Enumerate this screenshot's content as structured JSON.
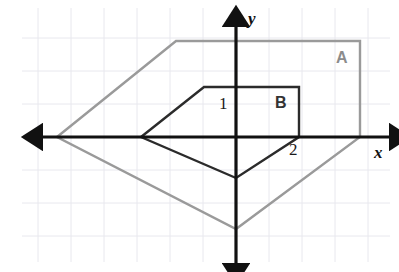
{
  "figure": {
    "width": 399,
    "height": 272,
    "background_color": "#ffffff"
  },
  "grid": {
    "visible": true,
    "spacing_px": 33,
    "color": "#e8e8ee",
    "origin_px": {
      "x": 236,
      "y": 137
    },
    "extent_px": {
      "left": 22,
      "right": 390,
      "top": 8,
      "bottom": 262
    }
  },
  "axes": {
    "color": "#111111",
    "stroke_width": 3.2,
    "x_axis": {
      "label": "x",
      "label_pos_px": {
        "x": 374,
        "y": 144
      },
      "from_px": {
        "x": 24,
        "y": 137
      },
      "to_px": {
        "x": 392,
        "y": 137
      },
      "arrows": "both"
    },
    "y_axis": {
      "label": "y",
      "label_pos_px": {
        "x": 248,
        "y": 10
      },
      "from_px": {
        "x": 236,
        "y": 8
      },
      "to_px": {
        "x": 236,
        "y": 266
      },
      "arrows": "both"
    }
  },
  "shapes": [
    {
      "id": "A",
      "label": "A",
      "label_pos_px": {
        "x": 336,
        "y": 50
      },
      "stroke_color": "#9a9a9a",
      "stroke_width": 2.4,
      "fill": "none",
      "closed": true,
      "vertices_px": [
        {
          "x": 57,
          "y": 137
        },
        {
          "x": 176,
          "y": 41
        },
        {
          "x": 360,
          "y": 41
        },
        {
          "x": 360,
          "y": 137
        },
        {
          "x": 236,
          "y": 229
        }
      ]
    },
    {
      "id": "B",
      "label": "B",
      "label_pos_px": {
        "x": 275,
        "y": 95
      },
      "stroke_color": "#2b2b2b",
      "stroke_width": 2.4,
      "fill": "none",
      "closed": true,
      "vertices_px": [
        {
          "x": 141,
          "y": 137
        },
        {
          "x": 204,
          "y": 87
        },
        {
          "x": 299,
          "y": 87
        },
        {
          "x": 299,
          "y": 137
        },
        {
          "x": 236,
          "y": 178
        }
      ]
    }
  ],
  "vertex_labels": [
    {
      "text": "1",
      "pos_px": {
        "x": 219,
        "y": 95
      }
    },
    {
      "text": "2",
      "pos_px": {
        "x": 289,
        "y": 141
      }
    }
  ]
}
